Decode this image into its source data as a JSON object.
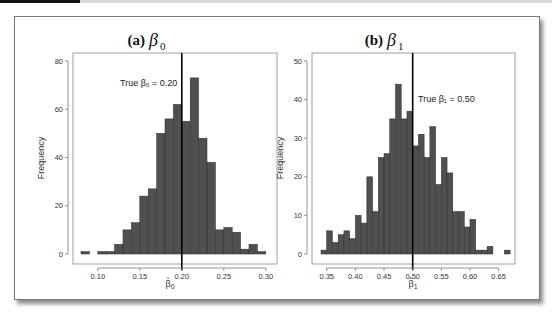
{
  "figure": {
    "panels": [
      {
        "title_prefix": "(a)",
        "title_symbol": "β",
        "title_sub": "0",
        "ylabel": "Frequency",
        "xlabel_symbol": "β",
        "xlabel_sub": "0",
        "annotation": "True β₀ = 0.20",
        "true_value": 0.2
      },
      {
        "title_prefix": "(b)",
        "title_symbol": "β",
        "title_sub": "1",
        "ylabel": "Frequency",
        "xlabel_symbol": "β",
        "xlabel_sub": "1",
        "annotation": "True β₁ = 0.50",
        "true_value": 0.5
      }
    ],
    "colors": {
      "bar_fill": "#505050",
      "vline": "#000000",
      "frame_border": "#777777"
    }
  },
  "chart_data": [
    {
      "type": "bar",
      "title": "(a) β0",
      "xlabel": "β̂0",
      "ylabel": "Frequency",
      "bin_width": 0.01,
      "bin_starts": [
        0.08,
        0.09,
        0.1,
        0.11,
        0.12,
        0.13,
        0.14,
        0.15,
        0.16,
        0.17,
        0.18,
        0.19,
        0.2,
        0.21,
        0.22,
        0.23,
        0.24,
        0.25,
        0.26,
        0.27,
        0.28,
        0.29
      ],
      "values": [
        1,
        0,
        1,
        1,
        4,
        10,
        13,
        24,
        27,
        50,
        56,
        62,
        55,
        73,
        48,
        38,
        10,
        11,
        9,
        2,
        4,
        1
      ],
      "xticks": [
        "0.10",
        "0.15",
        "0.20",
        "0.25",
        "0.30"
      ],
      "yticks": [
        "0",
        "20",
        "40",
        "60",
        "80"
      ],
      "xlim": [
        0.08,
        0.3
      ],
      "ylim": [
        0,
        80
      ],
      "vline": 0.2,
      "annotation": "True β0 = 0.20",
      "grid": false
    },
    {
      "type": "bar",
      "title": "(b) β1",
      "xlabel": "β̂1",
      "ylabel": "Frequency",
      "bin_width": 0.01,
      "bin_starts": [
        0.34,
        0.35,
        0.36,
        0.37,
        0.38,
        0.39,
        0.4,
        0.41,
        0.42,
        0.43,
        0.44,
        0.45,
        0.46,
        0.47,
        0.48,
        0.49,
        0.5,
        0.51,
        0.52,
        0.53,
        0.54,
        0.55,
        0.56,
        0.57,
        0.58,
        0.59,
        0.6,
        0.61,
        0.62,
        0.63,
        0.64,
        0.65,
        0.66
      ],
      "values": [
        1,
        6,
        3,
        5,
        6,
        4,
        10,
        8,
        20,
        11,
        25,
        26,
        35,
        44,
        35,
        37,
        28,
        31,
        25,
        33,
        18,
        25,
        21,
        11,
        11,
        7,
        9,
        1,
        1,
        2,
        0,
        0,
        1
      ],
      "xticks": [
        "0.35",
        "0.40",
        "0.45",
        "0.50",
        "0.55",
        "0.60",
        "0.65"
      ],
      "yticks": [
        "0",
        "10",
        "20",
        "30",
        "40",
        "50"
      ],
      "xlim": [
        0.34,
        0.67
      ],
      "ylim": [
        0,
        50
      ],
      "vline": 0.5,
      "annotation": "True β1 = 0.50",
      "grid": false
    }
  ]
}
